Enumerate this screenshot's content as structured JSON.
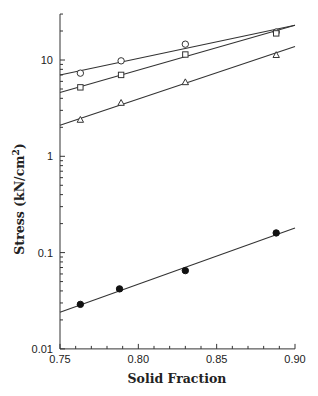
{
  "chart_data": {
    "type": "scatter",
    "title": "",
    "xlabel": "Solid Fraction",
    "ylabel": "Stress (kN/cm²)",
    "ylabel_parts": {
      "main": "Stress (kN/cm",
      "sup": "2",
      "close": ")"
    },
    "xscale": "linear",
    "yscale": "log",
    "xlim": [
      0.75,
      0.9
    ],
    "ylim": [
      0.01,
      30
    ],
    "x_ticks": [
      0.75,
      0.8,
      0.85,
      0.9
    ],
    "x_tick_labels": [
      "0.75",
      "0.80",
      "0.85",
      "0.90"
    ],
    "x_minor_step": 0.01,
    "y_ticks": [
      0.01,
      0.1,
      1,
      10
    ],
    "y_tick_labels": [
      "0.01",
      "0.1",
      "1",
      "10"
    ],
    "grid": false,
    "legend": null,
    "series": [
      {
        "name": "open-circle",
        "marker": "circle-open",
        "x": [
          0.763,
          0.789,
          0.83,
          0.888
        ],
        "y": [
          7.3,
          9.8,
          14.6,
          19.5
        ],
        "fit": {
          "x": [
            0.75,
            0.9
          ],
          "y": [
            7.0,
            23.0
          ]
        }
      },
      {
        "name": "open-square",
        "marker": "square-open",
        "x": [
          0.763,
          0.789,
          0.83,
          0.888
        ],
        "y": [
          5.2,
          7.0,
          11.4,
          18.9
        ],
        "fit": {
          "x": [
            0.75,
            0.9
          ],
          "y": [
            4.6,
            23.0
          ]
        }
      },
      {
        "name": "open-triangle",
        "marker": "triangle-open",
        "x": [
          0.763,
          0.789,
          0.83,
          0.888
        ],
        "y": [
          2.4,
          3.6,
          5.9,
          11.3
        ],
        "fit": {
          "x": [
            0.75,
            0.9
          ],
          "y": [
            2.1,
            13.8
          ]
        }
      },
      {
        "name": "filled-circle",
        "marker": "circle-filled",
        "x": [
          0.763,
          0.788,
          0.83,
          0.888
        ],
        "y": [
          0.029,
          0.042,
          0.065,
          0.16
        ],
        "fit": {
          "x": [
            0.75,
            0.9
          ],
          "y": [
            0.024,
            0.18
          ]
        }
      }
    ]
  }
}
